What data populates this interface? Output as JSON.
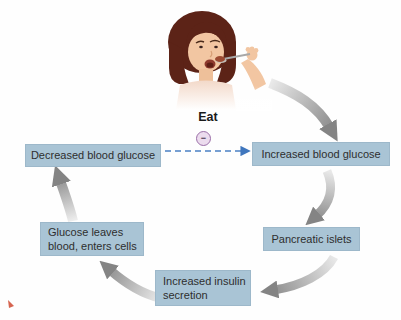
{
  "diagram": {
    "eat_label": "Eat",
    "inhibition_symbol": "−",
    "nodes": {
      "eat": "Eat",
      "decreased_blood_glucose": "Decreased blood glucose",
      "increased_blood_glucose": "Increased blood glucose",
      "pancreatic_islets": "Pancreatic islets",
      "increased_insulin_secretion": "Increased insulin secretion",
      "glucose_leaves_blood": "Glucose leaves blood, enters cells"
    },
    "edges": [
      {
        "from": "eat",
        "to": "increased_blood_glucose",
        "type": "gray-curved-arrow"
      },
      {
        "from": "increased_blood_glucose",
        "to": "pancreatic_islets",
        "type": "gray-curved-arrow"
      },
      {
        "from": "pancreatic_islets",
        "to": "increased_insulin_secretion",
        "type": "gray-curved-arrow"
      },
      {
        "from": "increased_insulin_secretion",
        "to": "glucose_leaves_blood",
        "type": "gray-curved-arrow"
      },
      {
        "from": "glucose_leaves_blood",
        "to": "decreased_blood_glucose",
        "type": "gray-curved-arrow"
      },
      {
        "from": "decreased_blood_glucose",
        "to": "increased_blood_glucose",
        "type": "dashed-blue-inhibition"
      }
    ],
    "colors": {
      "box_fill": "#a9c4d5",
      "box_text": "#2e2e2e",
      "dashed_arrow_blue": "#4a80c4",
      "inhibition_ring_purple": "#9b6fa8",
      "inhibition_fill": "#ecdcee",
      "arrow_gradient_light": "#e4e4e4",
      "arrow_gradient_dark": "#8a8a8a",
      "hair_brown": "#5c2317",
      "skin": "#f2c6a2",
      "red_mark": "#cf4a31"
    }
  }
}
